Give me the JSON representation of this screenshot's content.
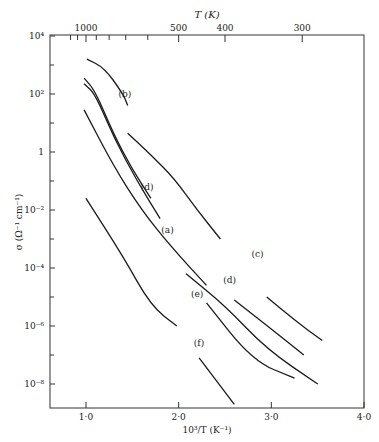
{
  "chart_data": {
    "type": "line",
    "title": "",
    "xlabel": "10³/T (K⁻¹)",
    "ylabel": "σ (Ω⁻¹ cm⁻¹)",
    "top_xlabel": "T (K)",
    "xlim": [
      0.6,
      4.0
    ],
    "ylim_log10": [
      -9,
      4
    ],
    "x_ticks": [
      {
        "v": 1.0,
        "label": "1·0"
      },
      {
        "v": 2.0,
        "label": "2·0"
      },
      {
        "v": 3.0,
        "label": "3·0"
      },
      {
        "v": 4.0,
        "label": "4·0"
      }
    ],
    "y_ticks": [
      {
        "exp": 4,
        "label": "10⁴"
      },
      {
        "exp": 2,
        "label": "10²"
      },
      {
        "exp": 0,
        "label": "1"
      },
      {
        "exp": -2,
        "label": "10⁻²"
      },
      {
        "exp": -4,
        "label": "10⁻⁴"
      },
      {
        "exp": -6,
        "label": "10⁻⁶"
      },
      {
        "exp": -8,
        "label": "10⁻⁸"
      }
    ],
    "top_ticks": [
      {
        "T": 1000,
        "label": "1000"
      },
      {
        "T": 500,
        "label": "500"
      },
      {
        "T": 400,
        "label": "400"
      },
      {
        "T": 300,
        "label": "300"
      }
    ],
    "top_minor_T": [
      1200,
      1100,
      900,
      800,
      700,
      600
    ],
    "series": [
      {
        "name": "b",
        "points": [
          [
            1.01,
            3.2
          ],
          [
            1.2,
            2.9
          ],
          [
            1.4,
            2.0
          ],
          [
            1.45,
            1.6
          ]
        ]
      },
      {
        "name": "d-upper",
        "points": [
          [
            0.98,
            2.55
          ],
          [
            1.1,
            2.1
          ],
          [
            1.3,
            0.6
          ],
          [
            1.5,
            -0.6
          ],
          [
            1.7,
            -1.6
          ]
        ]
      },
      {
        "name": "a-upper",
        "points": [
          [
            0.98,
            2.35
          ],
          [
            1.1,
            2.0
          ],
          [
            1.3,
            0.5
          ],
          [
            1.55,
            -1.0
          ],
          [
            1.8,
            -2.3
          ]
        ]
      },
      {
        "name": "c-upper",
        "points": [
          [
            1.45,
            0.65
          ],
          [
            1.7,
            -0.1
          ],
          [
            1.95,
            -0.9
          ],
          [
            2.2,
            -2.0
          ],
          [
            2.45,
            -3.0
          ]
        ]
      },
      {
        "name": "a",
        "points": [
          [
            0.98,
            1.45
          ],
          [
            1.3,
            -0.5
          ],
          [
            1.6,
            -2.0
          ],
          [
            1.9,
            -3.2
          ],
          [
            2.3,
            -4.6
          ]
        ]
      },
      {
        "name": "e",
        "points": [
          [
            2.08,
            -4.2
          ],
          [
            2.5,
            -5.3
          ],
          [
            2.95,
            -6.8
          ],
          [
            3.5,
            -8.0
          ]
        ]
      },
      {
        "name": "d",
        "points": [
          [
            2.6,
            -5.1
          ],
          [
            3.0,
            -6.1
          ],
          [
            3.35,
            -7.0
          ]
        ]
      },
      {
        "name": "c",
        "points": [
          [
            2.95,
            -5.0
          ],
          [
            3.25,
            -5.8
          ],
          [
            3.55,
            -6.5
          ]
        ]
      },
      {
        "name": "f-upper",
        "points": [
          [
            1.0,
            -1.6
          ],
          [
            1.4,
            -3.6
          ],
          [
            1.7,
            -5.3
          ],
          [
            1.98,
            -6.0
          ]
        ]
      },
      {
        "name": "f-mid",
        "points": [
          [
            2.3,
            -5.2
          ],
          [
            2.8,
            -7.2
          ],
          [
            3.25,
            -7.8
          ]
        ]
      },
      {
        "name": "f",
        "points": [
          [
            2.22,
            -7.1
          ],
          [
            2.6,
            -8.7
          ]
        ]
      }
    ],
    "annotations": [
      {
        "label": "(b)",
        "x": 1.42,
        "y": 2.0
      },
      {
        "label": "(d)",
        "x": 1.66,
        "y": -1.2
      },
      {
        "label": "(a)",
        "x": 1.88,
        "y": -2.7
      },
      {
        "label": "(c)",
        "x": 2.85,
        "y": -3.5
      },
      {
        "label": "(d)",
        "x": 2.55,
        "y": -4.4
      },
      {
        "label": "(e)",
        "x": 2.2,
        "y": -4.9
      },
      {
        "label": "(f)",
        "x": 2.22,
        "y": -6.6
      }
    ]
  }
}
